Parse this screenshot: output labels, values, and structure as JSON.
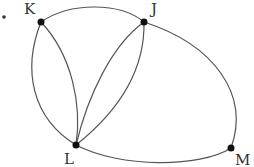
{
  "diagram": {
    "type": "graph",
    "bullet": "•",
    "vertices": [
      {
        "id": "K",
        "label": "K",
        "x": 41,
        "y": 22,
        "lx": 24,
        "ly": 14
      },
      {
        "id": "J",
        "label": "J",
        "x": 144,
        "y": 22,
        "lx": 151,
        "ly": 14
      },
      {
        "id": "L",
        "label": "L",
        "x": 76,
        "y": 145,
        "lx": 64,
        "ly": 164
      },
      {
        "id": "M",
        "label": "M",
        "x": 231,
        "y": 148,
        "lx": 235,
        "ly": 165
      }
    ],
    "edges": [
      {
        "from": "K",
        "to": "J"
      },
      {
        "from": "K",
        "to": "L"
      },
      {
        "from": "K",
        "to": "L"
      },
      {
        "from": "J",
        "to": "L"
      },
      {
        "from": "J",
        "to": "L"
      },
      {
        "from": "L",
        "to": "M"
      },
      {
        "from": "J",
        "to": "M"
      }
    ]
  }
}
